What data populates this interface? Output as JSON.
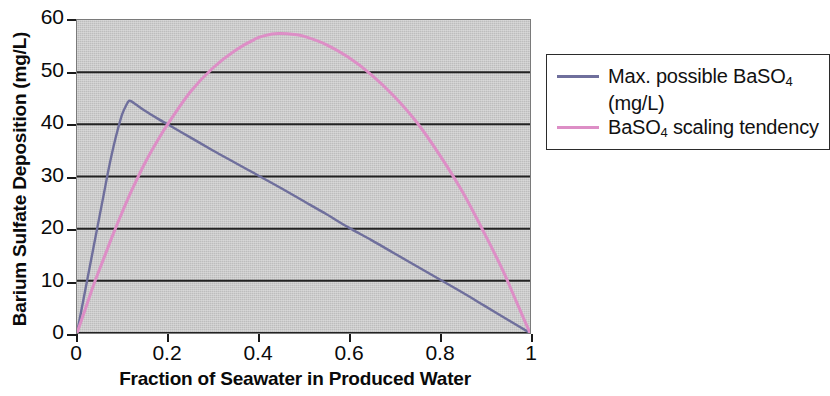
{
  "chart_data": {
    "type": "line",
    "title": "",
    "xlabel": "Fraction of Seawater in Produced Water",
    "ylabel": "Barium Sulfate Deposition (mg/L)",
    "xlim": [
      0,
      1
    ],
    "ylim": [
      0,
      60
    ],
    "xticks": [
      "0",
      "0.2",
      "0.4",
      "0.6",
      "0.8",
      "1"
    ],
    "xtick_values": [
      0,
      0.2,
      0.4,
      0.6,
      0.8,
      1
    ],
    "yticks": [
      "0",
      "10",
      "20",
      "30",
      "40",
      "50",
      "60"
    ],
    "ytick_values": [
      0,
      10,
      20,
      30,
      40,
      50,
      60
    ],
    "grid": "horizontal",
    "plot_background": "#c9c9c9",
    "legend_position": "right",
    "series": [
      {
        "name": "Max. possible BaSO4 (mg/L)",
        "name_rich": "Max. possible BaSO₄\n(mg/L)",
        "color": "#6f6f9c",
        "x": [
          0,
          0.01,
          0.02,
          0.03,
          0.04,
          0.05,
          0.06,
          0.07,
          0.08,
          0.09,
          0.1,
          0.11,
          0.115,
          0.12,
          0.13,
          0.15,
          0.18,
          0.2,
          0.25,
          0.3,
          0.35,
          0.4,
          0.45,
          0.5,
          0.55,
          0.6,
          0.65,
          0.7,
          0.75,
          0.8,
          0.85,
          0.9,
          0.95,
          1.0
        ],
        "y": [
          0,
          4.5,
          9.0,
          13.5,
          18.0,
          22.5,
          27.0,
          31.5,
          35.5,
          39.0,
          42.0,
          43.9,
          44.5,
          44.4,
          43.8,
          42.6,
          41.0,
          40.0,
          37.5,
          35.0,
          32.6,
          30.2,
          27.8,
          25.3,
          22.8,
          20.2,
          17.8,
          15.3,
          12.8,
          10.3,
          7.8,
          5.2,
          2.6,
          0
        ]
      },
      {
        "name": "BaSO4 scaling tendency",
        "name_rich": "BaSO₄ scaling tendency",
        "color": "#dd8ec6",
        "x": [
          0,
          0.02,
          0.04,
          0.06,
          0.08,
          0.1,
          0.12,
          0.15,
          0.18,
          0.2,
          0.25,
          0.3,
          0.35,
          0.4,
          0.43,
          0.45,
          0.48,
          0.5,
          0.55,
          0.6,
          0.65,
          0.7,
          0.75,
          0.8,
          0.85,
          0.9,
          0.94,
          0.97,
          1.0
        ],
        "y": [
          0,
          5.0,
          10.0,
          14.5,
          19.0,
          23.2,
          27.2,
          32.6,
          37.2,
          40.0,
          46.2,
          50.8,
          54.2,
          56.6,
          57.3,
          57.4,
          57.2,
          56.9,
          55.3,
          52.8,
          49.5,
          45.4,
          40.4,
          34.2,
          27.2,
          19.0,
          12.0,
          6.0,
          0
        ]
      }
    ]
  },
  "axes": {
    "y_title": "Barium Sulfate Deposition (mg/L)",
    "x_title": "Fraction of Seawater in Produced Water"
  },
  "legend": {
    "entries": [
      {
        "label": "Max. possible BaSO",
        "sub": "4",
        "label2": "(mg/L)",
        "color": "#6f6f9c"
      },
      {
        "label": "BaSO",
        "sub": "4",
        "label_tail": " scaling tendency",
        "color": "#dd8ec6"
      }
    ]
  }
}
